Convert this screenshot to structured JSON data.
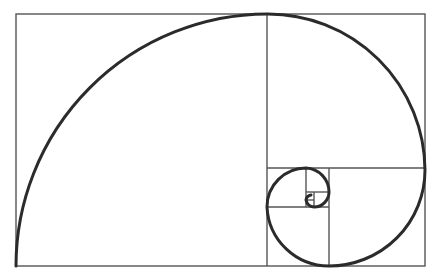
{
  "diagram": {
    "title": "",
    "type": "golden-spiral",
    "colors": {
      "background": "#ffffff",
      "grid_lines": "#555555",
      "spiral": "#2b2b2b"
    },
    "outer_rectangle": {
      "x": 16,
      "y": 14,
      "width": 409,
      "height": 252
    },
    "squares": [
      {
        "x": 16,
        "y": 14,
        "size": 252
      },
      {
        "x": 267,
        "y": 14,
        "size": 157
      },
      {
        "x": 329,
        "y": 168,
        "size": 96
      },
      {
        "x": 267,
        "y": 207,
        "size": 62
      },
      {
        "x": 267,
        "y": 168,
        "size": 39
      },
      {
        "x": 306,
        "y": 168,
        "size": 24
      },
      {
        "x": 314,
        "y": 192,
        "size": 15
      },
      {
        "x": 306,
        "y": 200,
        "size": 9
      }
    ]
  }
}
